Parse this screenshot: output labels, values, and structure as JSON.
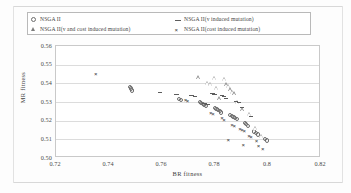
{
  "chart_data": {
    "type": "scatter",
    "title": "",
    "xlabel": "BR fitness",
    "ylabel": "MR fitness",
    "xlim": [
      0.72,
      0.82
    ],
    "ylim": [
      0.5,
      0.56
    ],
    "xticks": [
      "0.72",
      "0.74",
      "0.76",
      "0.78",
      "0.8",
      "0.82"
    ],
    "xtick_values": [
      0.72,
      0.74,
      0.76,
      0.78,
      0.8,
      0.82
    ],
    "yticks": [
      "0.56",
      "0.55",
      "0.54",
      "0.53",
      "0.52",
      "0.51",
      "0.50"
    ],
    "ytick_values": [
      0.56,
      0.55,
      0.54,
      0.53,
      0.52,
      0.51,
      0.5
    ],
    "grid": "horizontal",
    "legend_position": "top",
    "series": [
      {
        "name": "NSGA II",
        "marker": "circle",
        "color": "#6d6d6d",
        "points": [
          [
            0.7478,
            0.5382
          ],
          [
            0.7482,
            0.5372
          ],
          [
            0.7486,
            0.5362
          ],
          [
            0.7665,
            0.5318
          ],
          [
            0.7672,
            0.531
          ],
          [
            0.7742,
            0.5302
          ],
          [
            0.7748,
            0.5296
          ],
          [
            0.7754,
            0.529
          ],
          [
            0.776,
            0.5284
          ],
          [
            0.7766,
            0.5278
          ],
          [
            0.78,
            0.5268
          ],
          [
            0.7806,
            0.5262
          ],
          [
            0.7812,
            0.5256
          ],
          [
            0.7818,
            0.525
          ],
          [
            0.7824,
            0.5244
          ],
          [
            0.7858,
            0.5232
          ],
          [
            0.7864,
            0.5226
          ],
          [
            0.787,
            0.522
          ],
          [
            0.7876,
            0.5214
          ],
          [
            0.7882,
            0.5208
          ],
          [
            0.7912,
            0.5188
          ],
          [
            0.7918,
            0.518
          ],
          [
            0.7924,
            0.5172
          ],
          [
            0.7948,
            0.5142
          ],
          [
            0.7956,
            0.5134
          ],
          [
            0.7962,
            0.5126
          ],
          [
            0.7988,
            0.5102
          ],
          [
            0.7996,
            0.5094
          ]
        ]
      },
      {
        "name": "NSGA II(v and cost induced mutation)",
        "marker": "triangle",
        "color": "#8a8a8a",
        "points": [
          [
            0.774,
            0.543
          ],
          [
            0.78,
            0.5428
          ],
          [
            0.7836,
            0.5422
          ],
          [
            0.7772,
            0.54
          ],
          [
            0.7784,
            0.5396
          ],
          [
            0.7846,
            0.5392
          ],
          [
            0.7852,
            0.5386
          ],
          [
            0.7806,
            0.5374
          ],
          [
            0.7858,
            0.5366
          ],
          [
            0.7866,
            0.5352
          ],
          [
            0.7874,
            0.5344
          ],
          [
            0.7818,
            0.5318
          ],
          [
            0.7886,
            0.53
          ],
          [
            0.7906,
            0.5258
          ],
          [
            0.793,
            0.5236
          ],
          [
            0.7954,
            0.516
          ],
          [
            0.7978,
            0.5118
          ]
        ]
      },
      {
        "name": "NSGA II(v induced mutation)",
        "marker": "dash",
        "color": "#5c5c5c",
        "points": [
          [
            0.7592,
            0.5352
          ],
          [
            0.7654,
            0.5344
          ],
          [
            0.7712,
            0.5338
          ],
          [
            0.7724,
            0.5332
          ],
          [
            0.779,
            0.5348
          ],
          [
            0.7798,
            0.5342
          ],
          [
            0.7826,
            0.5336
          ],
          [
            0.7834,
            0.533
          ],
          [
            0.7842,
            0.5322
          ],
          [
            0.776,
            0.5294
          ],
          [
            0.7772,
            0.5288
          ],
          [
            0.788,
            0.5304
          ],
          [
            0.789,
            0.5298
          ],
          [
            0.7902,
            0.5272
          ],
          [
            0.7936,
            0.5226
          ]
        ]
      },
      {
        "name": "NSGA II(cost induced mutation)",
        "marker": "x",
        "color": "#2f2f2f",
        "points": [
          [
            0.7352,
            0.5448
          ],
          [
            0.769,
            0.5308
          ],
          [
            0.7698,
            0.5302
          ],
          [
            0.7786,
            0.5242
          ],
          [
            0.7794,
            0.5236
          ],
          [
            0.7828,
            0.5212
          ],
          [
            0.7836,
            0.5204
          ],
          [
            0.7866,
            0.5178
          ],
          [
            0.7874,
            0.5172
          ],
          [
            0.7896,
            0.5156
          ],
          [
            0.7904,
            0.515
          ],
          [
            0.7912,
            0.5144
          ],
          [
            0.793,
            0.5118
          ],
          [
            0.7938,
            0.5112
          ],
          [
            0.7958,
            0.5088
          ],
          [
            0.7966,
            0.5064
          ],
          [
            0.7982,
            0.5046
          ],
          [
            0.7908,
            0.507
          ],
          [
            0.7852,
            0.5094
          ]
        ]
      }
    ]
  },
  "legend": {
    "items": [
      {
        "label": "NSGA II",
        "marker": "circle-marker"
      },
      {
        "label": "NSGA II(v and cost induced mutation)",
        "marker": "triangle-marker"
      },
      {
        "label": "NSGA II(v induced mutation)",
        "marker": "dash-marker"
      },
      {
        "label": "NSGA II(cost induced mutation)",
        "marker": "x-marker"
      }
    ]
  },
  "axes": {
    "x_title": "BR fitness",
    "y_title": "MR fitness"
  }
}
